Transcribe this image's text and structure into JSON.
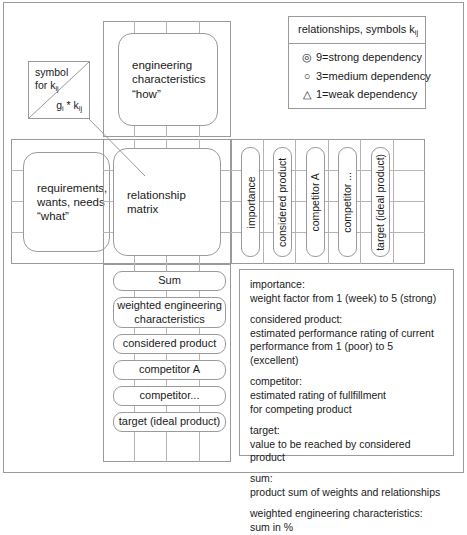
{
  "diagram": {
    "accent_color": "#9a9a9a",
    "gridline_color": "#b4b4b4",
    "background_color": "#ffffff"
  },
  "symbol_key": {
    "label_line1": "symbol",
    "label_line2": "for k",
    "label_sub": "ij",
    "product_expr": "g",
    "product_sub1": "i",
    "product_mid": " * k",
    "product_sub2": "ij"
  },
  "legend": {
    "title_text": "relationships, symbols k",
    "title_sub": "ij",
    "items": [
      {
        "symbol": "double-circle",
        "glyph": "◎",
        "label": "9=strong dependency"
      },
      {
        "symbol": "circle",
        "glyph": "○",
        "label": "3=medium dependency"
      },
      {
        "symbol": "triangle",
        "glyph": "△",
        "label": "1=weak dependency"
      }
    ]
  },
  "matrix": {
    "roof_label": "engineering\ncharacteristics\n“how”",
    "left_label": "requirements,\nwants, needs\n“what”",
    "center_label": "relationship\nmatrix"
  },
  "right_columns": [
    {
      "label": "importance"
    },
    {
      "label": "considered product"
    },
    {
      "label": "competitor A"
    },
    {
      "label": "competitor ..."
    },
    {
      "label": "target (ideal product)"
    }
  ],
  "bottom_rows": [
    {
      "label": "Sum"
    },
    {
      "label": "weighted engineering\ncharacteristics"
    },
    {
      "label": "considered product"
    },
    {
      "label": "competitor A"
    },
    {
      "label": "competitor..."
    },
    {
      "label": "target (ideal product)"
    }
  ],
  "descriptions": [
    {
      "term": "importance:",
      "text": "weight factor from  1 (week) to 5 (strong)"
    },
    {
      "term": "considered product:",
      "text": "estimated performance rating of current\nperformance from 1 (poor) to 5 (excellent)"
    },
    {
      "term": "competitor:",
      "text": "estimated rating of fullfillment\nfor competing product"
    },
    {
      "term": "target:",
      "text": "value to be reached by considered product"
    },
    {
      "term": "sum:",
      "text": "product sum of weights and relationships"
    },
    {
      "term": "weighted engineering characteristics:",
      "text": "sum in %"
    }
  ]
}
